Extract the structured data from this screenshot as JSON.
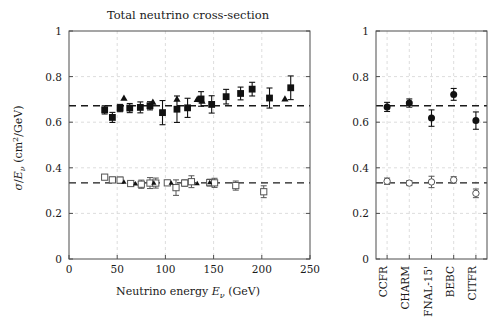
{
  "figure": {
    "title": "Total neutrino cross-section",
    "background": "#ffffff"
  },
  "chart_data": [
    {
      "id": "energy-panel",
      "type": "scatter",
      "title": "Total neutrino cross-section",
      "xlabel": "Neutrino energy E_ν (GeV)",
      "ylabel": "σ/E_ν (cm²/GeV)",
      "xlim": [
        0,
        250
      ],
      "ylim": [
        0,
        1
      ],
      "xticks": [
        0,
        50,
        100,
        150,
        200,
        250
      ],
      "xticklabels": [
        "0",
        "50",
        "100",
        "150",
        "200",
        "250"
      ],
      "yticks": [
        0,
        0.2,
        0.4,
        0.6,
        0.8,
        1
      ],
      "yticklabels": [
        "0",
        "0.2",
        "0.4",
        "0.6",
        "0.8",
        "1"
      ],
      "grid": true,
      "legend": "none",
      "reference_lines": [
        {
          "name": "neutrino-mean",
          "value": 0.672,
          "style": "dashed"
        },
        {
          "name": "antineutrino-mean",
          "value": 0.334,
          "style": "dashed"
        }
      ],
      "series": [
        {
          "name": "neutrino-filled-squares",
          "marker": "filled-square",
          "points": [
            {
              "x": 37,
              "y": 0.654,
              "yerr": 0.018
            },
            {
              "x": 45,
              "y": 0.621,
              "yerr": 0.022
            },
            {
              "x": 53,
              "y": 0.662,
              "yerr": 0.016
            },
            {
              "x": 63,
              "y": 0.662,
              "yerr": 0.02
            },
            {
              "x": 74,
              "y": 0.665,
              "yerr": 0.024
            },
            {
              "x": 84,
              "y": 0.672,
              "yerr": 0.018
            },
            {
              "x": 97,
              "y": 0.642,
              "yerr": 0.053
            },
            {
              "x": 112,
              "y": 0.657,
              "yerr": 0.058
            },
            {
              "x": 123,
              "y": 0.663,
              "yerr": 0.042
            },
            {
              "x": 137,
              "y": 0.702,
              "yerr": 0.032
            },
            {
              "x": 148,
              "y": 0.678,
              "yerr": 0.038
            },
            {
              "x": 163,
              "y": 0.712,
              "yerr": 0.032
            },
            {
              "x": 178,
              "y": 0.726,
              "yerr": 0.028
            },
            {
              "x": 190,
              "y": 0.745,
              "yerr": 0.03
            },
            {
              "x": 208,
              "y": 0.706,
              "yerr": 0.044
            },
            {
              "x": 230,
              "y": 0.751,
              "yerr": 0.052
            }
          ]
        },
        {
          "name": "neutrino-triangles",
          "marker": "filled-triangle",
          "points": [
            {
              "x": 57,
              "y": 0.706
            },
            {
              "x": 87,
              "y": 0.688
            },
            {
              "x": 112,
              "y": 0.701
            },
            {
              "x": 133,
              "y": 0.7
            },
            {
              "x": 138,
              "y": 0.692
            },
            {
              "x": 224,
              "y": 0.702
            }
          ]
        },
        {
          "name": "antineutrino-open-squares",
          "marker": "open-square",
          "points": [
            {
              "x": 37,
              "y": 0.359,
              "yerr": 0.011
            },
            {
              "x": 45,
              "y": 0.347,
              "yerr": 0.012
            },
            {
              "x": 53,
              "y": 0.346,
              "yerr": 0.013
            },
            {
              "x": 64,
              "y": 0.331,
              "yerr": 0.01
            },
            {
              "x": 75,
              "y": 0.328,
              "yerr": 0.018
            },
            {
              "x": 84,
              "y": 0.333,
              "yerr": 0.024
            },
            {
              "x": 90,
              "y": 0.333,
              "yerr": 0.022
            },
            {
              "x": 102,
              "y": 0.334,
              "yerr": 0.01
            },
            {
              "x": 111,
              "y": 0.313,
              "yerr": 0.034
            },
            {
              "x": 120,
              "y": 0.333,
              "yerr": 0.014
            },
            {
              "x": 127,
              "y": 0.339,
              "yerr": 0.026
            },
            {
              "x": 146,
              "y": 0.335,
              "yerr": 0.015
            },
            {
              "x": 151,
              "y": 0.334,
              "yerr": 0.02
            },
            {
              "x": 173,
              "y": 0.322,
              "yerr": 0.02
            },
            {
              "x": 202,
              "y": 0.295,
              "yerr": 0.026
            }
          ]
        },
        {
          "name": "antineutrino-markers",
          "marker": "filled-small",
          "points": [
            {
              "x": 57,
              "y": 0.338
            },
            {
              "x": 69,
              "y": 0.331
            },
            {
              "x": 88,
              "y": 0.334
            },
            {
              "x": 106,
              "y": 0.334
            },
            {
              "x": 133,
              "y": 0.332
            },
            {
              "x": 146,
              "y": 0.336
            }
          ]
        }
      ]
    },
    {
      "id": "experiment-panel",
      "type": "scatter",
      "title": "",
      "xlabel": "",
      "ylabel": "",
      "ylim": [
        0,
        1
      ],
      "yticks": [
        0,
        0.2,
        0.4,
        0.6,
        0.8,
        1
      ],
      "yticklabels": [
        "0",
        "0.2",
        "0.4",
        "0.6",
        "0.8",
        "1"
      ],
      "categories": [
        "CCFR",
        "CHARM",
        "FNAL-15'",
        "BEBC",
        "CITFR"
      ],
      "grid": true,
      "legend": "none",
      "reference_lines": [
        {
          "name": "neutrino-mean",
          "value": 0.672,
          "style": "dashed"
        },
        {
          "name": "antineutrino-mean",
          "value": 0.334,
          "style": "dashed"
        }
      ],
      "series": [
        {
          "name": "neutrino-filled-circles",
          "marker": "filled-circle",
          "values": [
            0.667,
            0.684,
            0.618,
            0.722,
            0.607
          ],
          "yerr": [
            0.02,
            0.018,
            0.036,
            0.026,
            0.038
          ]
        },
        {
          "name": "antineutrino-open-circles",
          "marker": "open-circle",
          "values": [
            0.341,
            0.333,
            0.338,
            0.347,
            0.288
          ],
          "yerr": [
            0.014,
            0.011,
            0.025,
            0.014,
            0.019
          ]
        }
      ]
    }
  ]
}
